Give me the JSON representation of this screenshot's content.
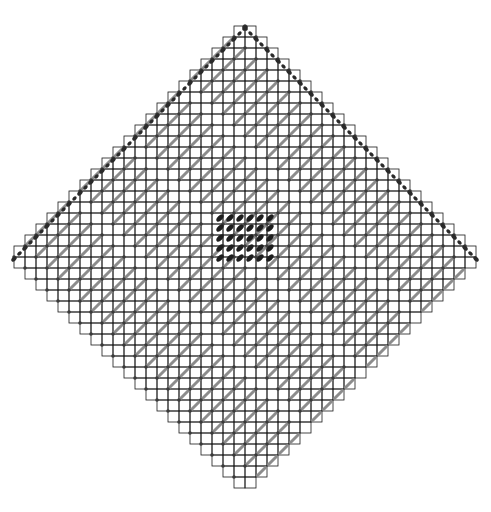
{
  "title": "",
  "diagram": {
    "type": "aztec-diamond-domino-tiling",
    "canvas": {
      "width": 491,
      "height": 512
    },
    "cell_size": 11,
    "center": {
      "x": 245,
      "y": 257
    },
    "half_extent_cells": 21,
    "colors": {
      "background": "#ffffff",
      "grid_line": "#1a1a1a",
      "stripe": "#8c8c8c",
      "vertex_marker": "#3a3a3a",
      "edge_dot": "#2a2a2a",
      "core_dimer": "#1e1e1e"
    },
    "core_cluster": {
      "cols": 6,
      "rows": 5,
      "center_x": 245,
      "center_y": 238,
      "spacing": 10
    },
    "regions": [
      {
        "name": "upper-frozen-edge",
        "description": "dark dimers along upper-left and upper-right boundaries"
      },
      {
        "name": "striped-lattice",
        "description": "gray diagonal stripes in alternating cells"
      },
      {
        "name": "central-core",
        "description": "dense dark dimer cluster"
      }
    ]
  }
}
